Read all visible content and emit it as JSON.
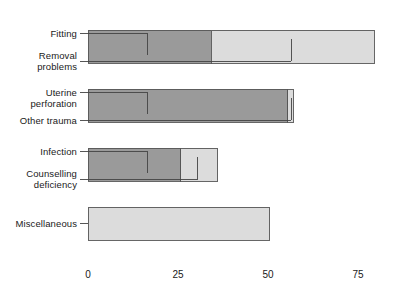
{
  "chart_data": {
    "type": "bar",
    "orientation": "horizontal",
    "stacked": true,
    "title": "",
    "xlabel": "",
    "ylabel": "",
    "xlim": [
      0,
      82
    ],
    "xticks": [
      0,
      25,
      50,
      75
    ],
    "xtick_labels": [
      "0",
      "25",
      "50",
      "75"
    ],
    "grid": "vertical-dotted",
    "legend": "none",
    "axis_color": "#808080",
    "grid_color": "#aaaaaa",
    "colors": {
      "dark_segment": "#9a9a9a",
      "light_segment": "#dcdcdc",
      "bar_outline": "#555555",
      "leader_line": "#444444"
    },
    "bars": [
      {
        "name": "bar-1",
        "segments": [
          {
            "label": "dark",
            "start": 0,
            "end": 34.2,
            "value": 34.2,
            "color": "dark_segment"
          },
          {
            "label": "light",
            "start": 34.2,
            "end": 79.5,
            "value": 45.3,
            "color": "light_segment"
          }
        ],
        "total": 79.5,
        "annotations": [
          {
            "label": "Fitting",
            "value": 16.5,
            "side": "top"
          },
          {
            "label": "Removal\nproblems",
            "value": 56.5,
            "side": "bottom"
          }
        ]
      },
      {
        "name": "bar-2",
        "segments": [
          {
            "label": "dark",
            "start": 0,
            "end": 55.5,
            "value": 55.5,
            "color": "dark_segment"
          },
          {
            "label": "light",
            "start": 55.5,
            "end": 57.0,
            "value": 1.5,
            "color": "light_segment"
          }
        ],
        "total": 57.0,
        "annotations": [
          {
            "label": "Uterine\nperforation",
            "value": 16.5,
            "side": "top"
          },
          {
            "label": "Other trauma",
            "value": 56.5,
            "side": "bottom"
          }
        ]
      },
      {
        "name": "bar-3",
        "segments": [
          {
            "label": "dark",
            "start": 0,
            "end": 25.8,
            "value": 25.8,
            "color": "dark_segment"
          },
          {
            "label": "light",
            "start": 25.8,
            "end": 36.0,
            "value": 10.2,
            "color": "light_segment"
          }
        ],
        "total": 36.0,
        "annotations": [
          {
            "label": "Infection",
            "value": 16.5,
            "side": "top"
          },
          {
            "label": "Counselling\ndeficiency",
            "value": 30.5,
            "side": "bottom"
          }
        ]
      },
      {
        "name": "bar-4",
        "segments": [
          {
            "label": "light",
            "start": 0,
            "end": 50.5,
            "value": 50.5,
            "color": "light_segment"
          }
        ],
        "total": 50.5,
        "annotations": [
          {
            "label": "Miscellaneous",
            "value": null,
            "side": "middle"
          }
        ]
      }
    ],
    "category_labels": [
      "Fitting",
      "Removal problems",
      "Uterine perforation",
      "Other trauma",
      "Infection",
      "Counselling deficiency",
      "Miscellaneous"
    ]
  }
}
